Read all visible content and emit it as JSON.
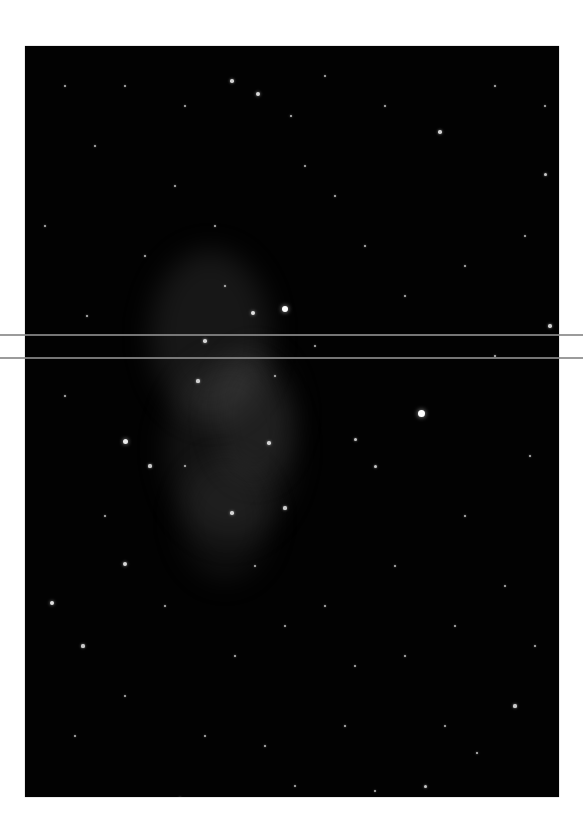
{
  "image": {
    "subject": "starfield-with-faint-nebula",
    "background_color": "#020202",
    "page_color": "#ffffff"
  },
  "artifacts": {
    "scanlines": [
      {
        "y": 334,
        "x_start": 0,
        "x_end": 583,
        "color": "#8a8a8a"
      },
      {
        "y": 357,
        "x_start": 0,
        "x_end": 583,
        "color": "#8a8a8a"
      }
    ]
  },
  "nebula": [
    {
      "x": 150,
      "y": 250,
      "w": 120,
      "h": 170,
      "color": "rgba(120,120,120,0.18)"
    },
    {
      "x": 165,
      "y": 360,
      "w": 130,
      "h": 180,
      "color": "rgba(110,110,110,0.16)"
    },
    {
      "x": 180,
      "y": 460,
      "w": 90,
      "h": 120,
      "color": "rgba(100,100,100,0.14)"
    },
    {
      "x": 215,
      "y": 350,
      "w": 80,
      "h": 130,
      "color": "rgba(130,130,130,0.12)"
    }
  ],
  "stars": [
    {
      "x": 396,
      "y": 367,
      "r": 3.5
    },
    {
      "x": 100,
      "y": 395,
      "r": 2.5
    },
    {
      "x": 260,
      "y": 263,
      "r": 3
    },
    {
      "x": 228,
      "y": 267,
      "r": 2.2
    },
    {
      "x": 233,
      "y": 48,
      "r": 2
    },
    {
      "x": 207,
      "y": 35,
      "r": 1.8
    },
    {
      "x": 266,
      "y": 70,
      "r": 1.4
    },
    {
      "x": 27,
      "y": 557,
      "r": 2.2
    },
    {
      "x": 100,
      "y": 518,
      "r": 2
    },
    {
      "x": 58,
      "y": 600,
      "r": 1.6
    },
    {
      "x": 125,
      "y": 420,
      "r": 1.6
    },
    {
      "x": 180,
      "y": 295,
      "r": 1.8
    },
    {
      "x": 173,
      "y": 335,
      "r": 1.6
    },
    {
      "x": 244,
      "y": 397,
      "r": 1.8
    },
    {
      "x": 207,
      "y": 467,
      "r": 1.8
    },
    {
      "x": 260,
      "y": 462,
      "r": 1.6
    },
    {
      "x": 330,
      "y": 393,
      "r": 1.5
    },
    {
      "x": 350,
      "y": 420,
      "r": 1.5
    },
    {
      "x": 415,
      "y": 86,
      "r": 1.8
    },
    {
      "x": 520,
      "y": 128,
      "r": 1.5
    },
    {
      "x": 525,
      "y": 280,
      "r": 1.7
    },
    {
      "x": 490,
      "y": 660,
      "r": 1.6
    },
    {
      "x": 452,
      "y": 707,
      "r": 1.4
    },
    {
      "x": 400,
      "y": 740,
      "r": 1.5
    },
    {
      "x": 85,
      "y": 772,
      "r": 1.4
    },
    {
      "x": 120,
      "y": 760,
      "r": 1.3
    },
    {
      "x": 155,
      "y": 752,
      "r": 1.4
    },
    {
      "x": 240,
      "y": 700,
      "r": 1.3
    },
    {
      "x": 320,
      "y": 680,
      "r": 1.3
    },
    {
      "x": 62,
      "y": 270,
      "r": 1.3
    },
    {
      "x": 120,
      "y": 210,
      "r": 1.3
    },
    {
      "x": 310,
      "y": 150,
      "r": 1.3
    },
    {
      "x": 340,
      "y": 200,
      "r": 1.3
    },
    {
      "x": 380,
      "y": 250,
      "r": 1.2
    },
    {
      "x": 440,
      "y": 220,
      "r": 1.2
    },
    {
      "x": 470,
      "y": 310,
      "r": 1.3
    },
    {
      "x": 505,
      "y": 410,
      "r": 1.2
    },
    {
      "x": 440,
      "y": 470,
      "r": 1.3
    },
    {
      "x": 370,
      "y": 520,
      "r": 1.2
    },
    {
      "x": 300,
      "y": 560,
      "r": 1.2
    },
    {
      "x": 210,
      "y": 610,
      "r": 1.3
    },
    {
      "x": 140,
      "y": 560,
      "r": 1.2
    },
    {
      "x": 80,
      "y": 470,
      "r": 1.2
    },
    {
      "x": 40,
      "y": 350,
      "r": 1.2
    },
    {
      "x": 20,
      "y": 180,
      "r": 1.2
    },
    {
      "x": 70,
      "y": 100,
      "r": 1.2
    },
    {
      "x": 150,
      "y": 140,
      "r": 1.2
    },
    {
      "x": 190,
      "y": 180,
      "r": 1.2
    },
    {
      "x": 280,
      "y": 120,
      "r": 1.1
    },
    {
      "x": 360,
      "y": 60,
      "r": 1.2
    },
    {
      "x": 470,
      "y": 40,
      "r": 1.2
    },
    {
      "x": 500,
      "y": 190,
      "r": 1.1
    },
    {
      "x": 330,
      "y": 620,
      "r": 1.1
    },
    {
      "x": 380,
      "y": 610,
      "r": 1.2
    },
    {
      "x": 430,
      "y": 580,
      "r": 1.1
    },
    {
      "x": 480,
      "y": 540,
      "r": 1.1
    },
    {
      "x": 510,
      "y": 600,
      "r": 1.2
    },
    {
      "x": 100,
      "y": 650,
      "r": 1.1
    },
    {
      "x": 50,
      "y": 690,
      "r": 1.1
    },
    {
      "x": 180,
      "y": 690,
      "r": 1.1
    },
    {
      "x": 270,
      "y": 740,
      "r": 1.1
    },
    {
      "x": 350,
      "y": 745,
      "r": 1.1
    },
    {
      "x": 420,
      "y": 680,
      "r": 1.1
    },
    {
      "x": 160,
      "y": 60,
      "r": 1.1
    },
    {
      "x": 100,
      "y": 40,
      "r": 1.1
    },
    {
      "x": 40,
      "y": 40,
      "r": 1.1
    },
    {
      "x": 300,
      "y": 30,
      "r": 1.1
    },
    {
      "x": 520,
      "y": 60,
      "r": 1.1
    },
    {
      "x": 250,
      "y": 330,
      "r": 1.2
    },
    {
      "x": 200,
      "y": 240,
      "r": 1.2
    },
    {
      "x": 290,
      "y": 300,
      "r": 1.1
    },
    {
      "x": 160,
      "y": 420,
      "r": 1.1
    },
    {
      "x": 230,
      "y": 520,
      "r": 1.1
    },
    {
      "x": 260,
      "y": 580,
      "r": 1.1
    }
  ]
}
